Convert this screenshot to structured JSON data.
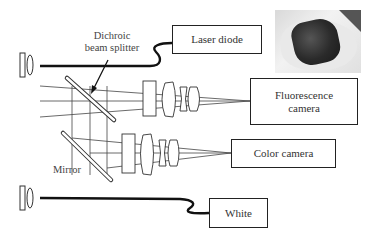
{
  "diagram": {
    "labels": {
      "dichroic_line1": "Dichroic",
      "dichroic_line2": "beam splitter",
      "mirror": "Mirror"
    },
    "boxes": {
      "laser_diode": "Laser diode",
      "fluorescence_line1": "Fluorescence",
      "fluorescence_line2": "camera",
      "color_camera": "Color camera",
      "white": "White"
    },
    "photo": "handheld-device-photo",
    "colors": {
      "line": "#222222",
      "text": "#333333",
      "background": "#ffffff"
    }
  }
}
